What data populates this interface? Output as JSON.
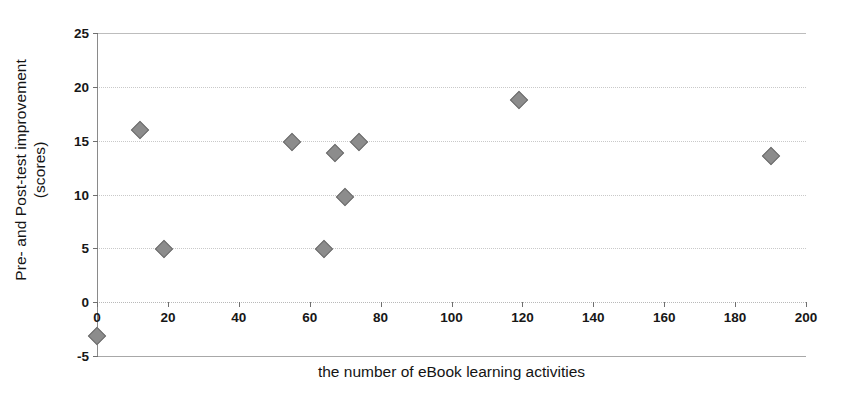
{
  "chart_data": {
    "type": "scatter",
    "title": "",
    "xlabel": "the number of eBook learning activities",
    "ylabel": "Pre- and Post-test improvement (scores)",
    "ylabel_line1": "Pre- and Post-test improvement",
    "ylabel_line2": "(scores)",
    "xlim": [
      0,
      200
    ],
    "ylim": [
      -5,
      25
    ],
    "xticks": [
      0,
      20,
      40,
      60,
      80,
      100,
      120,
      140,
      160,
      180,
      200
    ],
    "xticklabels": [
      "0",
      "20",
      "40",
      "60",
      "80",
      "100",
      "120",
      "140",
      "160",
      "180",
      "200"
    ],
    "yticks": [
      -5,
      0,
      5,
      10,
      15,
      20,
      25
    ],
    "yticklabels": [
      "-5",
      "0",
      "5",
      "10",
      "15",
      "20",
      "25"
    ],
    "grid": "horizontal-dotted",
    "legend": "none",
    "marker": "diamond",
    "marker_color": "#8c8c8c",
    "marker_edge_color": "#6e6e6e",
    "series": [
      {
        "name": "improvement",
        "points": [
          {
            "x": 0,
            "y": -3.1
          },
          {
            "x": 12,
            "y": 16.0
          },
          {
            "x": 19,
            "y": 4.9
          },
          {
            "x": 55,
            "y": 14.9
          },
          {
            "x": 64,
            "y": 4.9
          },
          {
            "x": 67,
            "y": 13.9
          },
          {
            "x": 70,
            "y": 9.8
          },
          {
            "x": 74,
            "y": 14.9
          },
          {
            "x": 119,
            "y": 18.8
          },
          {
            "x": 190,
            "y": 13.6
          }
        ]
      }
    ]
  }
}
